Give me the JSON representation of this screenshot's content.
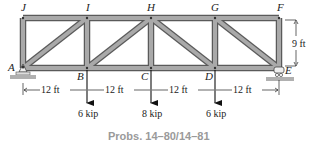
{
  "figure": {
    "caption": "Probs. 14–80/14–81",
    "colors": {
      "member_fill": "#a9a9a9",
      "member_edge": "#5a5a5a",
      "ground": "#b0b0b0",
      "caption": "#9a9a9a",
      "ink": "#222222"
    },
    "joints": {
      "J": "J",
      "I": "I",
      "H": "H",
      "G": "G",
      "F": "F",
      "A": "A",
      "B": "B",
      "C": "C",
      "D": "D",
      "E": "E"
    },
    "dimensions": {
      "height": "9 ft",
      "spans": [
        "12 ft",
        "12 ft",
        "12 ft",
        "12 ft"
      ]
    },
    "loads": {
      "B": "6 kip",
      "C": "8 kip",
      "D": "6 kip"
    },
    "supports": {
      "A": "pin",
      "E": "roller"
    }
  }
}
